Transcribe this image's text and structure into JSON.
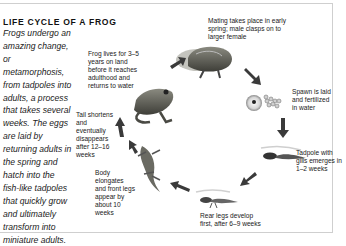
{
  "diagram": {
    "title": "LIFE CYCLE OF A FROG",
    "intro": "Frogs undergo an amazing change, or metamorphosis, from tadpoles into adults, a process that takes several weeks. The eggs are laid by returning adults in the spring and hatch into the fish-like tadpoles that quickly grow and ultimately transform into miniature adults.",
    "stages": [
      {
        "id": "mating",
        "caption": "Mating takes place in early spring; male clasps on to larger female"
      },
      {
        "id": "spawn",
        "caption": "Spawn is laid and fertilized in water"
      },
      {
        "id": "tadpole",
        "caption": "Tadpole with gills emerges in 1–2 weeks"
      },
      {
        "id": "rear-legs",
        "caption": "Rear legs develop first, after 6–9 weeks"
      },
      {
        "id": "front-legs",
        "caption": "Body elongates and front legs appear by about 10 weeks"
      },
      {
        "id": "tail",
        "caption": "Tail shortens and eventually disappears after 12–16 weeks"
      },
      {
        "id": "adult",
        "caption": "Frog lives for 3–5 years on land before it reaches adulthood and returns to water"
      }
    ]
  }
}
